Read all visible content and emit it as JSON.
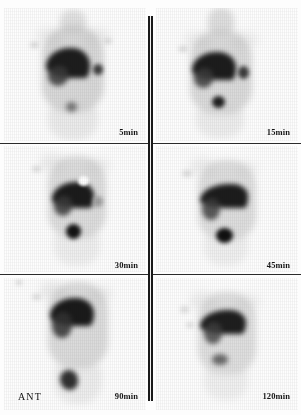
{
  "study": {
    "modality": "hepatobiliary-scintigraphy",
    "view_label": "ANT",
    "background_color": "#fdfdfd",
    "ink_color": "#1a1a1a"
  },
  "grid": {
    "rows": 3,
    "columns": 2,
    "divider_color": "#2b2b2b"
  },
  "panels": [
    {
      "id": "panel-5min",
      "time_label": "5min",
      "row": 1,
      "column": 1,
      "findings": "Liver uptake with cardiac blood pool; faint focal activity right of liver and midline bowel activity"
    },
    {
      "id": "panel-15min",
      "time_label": "15min",
      "row": 1,
      "column": 2,
      "findings": "Liver uptake with rounded focus lateral to liver and discrete midline focus inferiorly"
    },
    {
      "id": "panel-30min",
      "time_label": "30min",
      "row": 2,
      "column": 1,
      "findings": "Photopenic cold defect superior to liver; prominent round midline focus"
    },
    {
      "id": "panel-45min",
      "time_label": "45min",
      "row": 2,
      "column": 2,
      "findings": "Wedge-shaped liver activity with intense round focus inferiorly"
    },
    {
      "id": "panel-90min",
      "time_label": "90min",
      "row": 3,
      "column": 1,
      "findings": "Persistent liver activity with elongated midline bowel activity inferiorly"
    },
    {
      "id": "panel-120min",
      "time_label": "120min",
      "row": 3,
      "column": 2,
      "findings": "Decreasing liver activity with small residual midline focus"
    }
  ]
}
